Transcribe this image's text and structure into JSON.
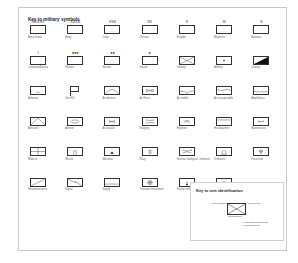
{
  "title": "Key to military symbols",
  "rows": [
    [
      {
        "label": "Army Group",
        "mark": "XXXXX",
        "icon": "army-group-icon",
        "shape": "plain"
      },
      {
        "label": "Army",
        "mark": "XXXX",
        "icon": "army-icon",
        "shape": "plain"
      },
      {
        "label": "Corps",
        "mark": "XXX",
        "icon": "corps-icon",
        "shape": "plain"
      },
      {
        "label": "Division",
        "mark": "XX",
        "icon": "division-icon",
        "shape": "plain"
      },
      {
        "label": "Brigade",
        "mark": "X",
        "icon": "brigade-icon",
        "shape": "plain"
      },
      {
        "label": "Regiment",
        "mark": "III",
        "icon": "regiment-icon",
        "shape": "plain"
      },
      {
        "label": "Battalion",
        "mark": "II",
        "icon": "battalion-icon",
        "shape": "plain"
      }
    ],
    [
      {
        "label": "Company/Battery",
        "mark": "I",
        "icon": "company-icon",
        "shape": "plain"
      },
      {
        "label": "Platoon",
        "mark": "●●●",
        "icon": "platoon-icon",
        "shape": "plain"
      },
      {
        "label": "Section",
        "mark": "●●",
        "icon": "section-icon",
        "shape": "plain"
      },
      {
        "label": "Squad",
        "mark": "●",
        "icon": "squad-icon",
        "shape": "plain"
      },
      {
        "label": "Infantry",
        "mark": "",
        "icon": "infantry-icon",
        "shape": "cross"
      },
      {
        "label": "Artillery",
        "mark": "",
        "icon": "artillery-icon",
        "shape": "dot"
      },
      {
        "label": "Cavalry",
        "mark": "",
        "icon": "cavalry-icon",
        "shape": "diag-fill"
      }
    ],
    [
      {
        "label": "Airborne",
        "mark": "",
        "icon": "airborne-icon",
        "shape": "airborne"
      },
      {
        "label": "Unit HQ",
        "mark": "",
        "icon": "unit-hq-icon",
        "shape": "flag"
      },
      {
        "label": "Air defence",
        "mark": "",
        "icon": "air-defence-icon",
        "shape": "arc"
      },
      {
        "label": "Air Force",
        "mark": "",
        "icon": "air-force-icon",
        "shape": "bowtie"
      },
      {
        "label": "Air mobile",
        "mark": "",
        "icon": "air-mobile-icon",
        "shape": "airmobile"
      },
      {
        "label": "Air transportable",
        "mark": "",
        "icon": "air-transportable-icon",
        "shape": "airtrans"
      },
      {
        "label": "Amphibious",
        "mark": "",
        "icon": "amphibious-icon",
        "shape": "wave"
      }
    ],
    [
      {
        "label": "Anti-tank",
        "mark": "",
        "icon": "anti-tank-icon",
        "shape": "antitank"
      },
      {
        "label": "Armour",
        "mark": "",
        "icon": "armour-icon",
        "shape": "oval"
      },
      {
        "label": "Air assault",
        "mark": "",
        "icon": "air-assault-icon",
        "shape": "bowtie-small"
      },
      {
        "label": "Bridging",
        "mark": "",
        "icon": "bridging-icon",
        "shape": "bridge"
      },
      {
        "label": "Engineer",
        "mark": "",
        "icon": "engineer-icon",
        "shape": "engineer"
      },
      {
        "label": "Headquarters",
        "mark": "",
        "icon": "headquarters-icon",
        "shape": "hq"
      },
      {
        "label": "Maintenance",
        "mark": "",
        "icon": "maintenance-icon",
        "shape": "maint"
      }
    ],
    [
      {
        "label": "Medical",
        "mark": "",
        "icon": "medical-icon",
        "shape": "medical"
      },
      {
        "label": "Missile",
        "mark": "",
        "icon": "missile-icon",
        "shape": "missile"
      },
      {
        "label": "Mountain",
        "mark": "",
        "icon": "mountain-icon",
        "shape": "mountain"
      },
      {
        "label": "Navy",
        "mark": "",
        "icon": "navy-icon",
        "shape": "anchor"
      },
      {
        "label": "Nuclear, biological, chemical",
        "mark": "",
        "icon": "nbc-icon",
        "shape": "nbc"
      },
      {
        "label": "Ordnance",
        "mark": "",
        "icon": "ordnance-icon",
        "shape": "ordnance"
      },
      {
        "label": "Parachute",
        "mark": "",
        "icon": "parachute-icon",
        "shape": "parachute"
      }
    ],
    [
      {
        "label": "Reconnaissance",
        "mark": "",
        "icon": "reconnaissance-icon",
        "shape": "diag"
      },
      {
        "label": "Signal",
        "mark": "",
        "icon": "signal-icon",
        "shape": "signal"
      },
      {
        "label": "Supply",
        "mark": "",
        "icon": "supply-icon",
        "shape": "supply"
      },
      {
        "label": "Transport movement",
        "mark": "",
        "icon": "transport-icon",
        "shape": "wheel"
      },
      {
        "label": "Rocket artillery",
        "mark": "",
        "icon": "rocket-artillery-icon",
        "shape": "rocket"
      },
      {
        "label": "Air defence artillery",
        "mark": "",
        "icon": "air-defence-artillery-icon",
        "shape": "arcdot"
      }
    ]
  ],
  "key_unit": {
    "title": "Key to unit identification",
    "unit_identifier": "Unit identifier",
    "parent_unit": "Parent unit",
    "commander": "Commander",
    "note_plus": "(+) with added elements",
    "note_minus": "(-) less elements"
  }
}
